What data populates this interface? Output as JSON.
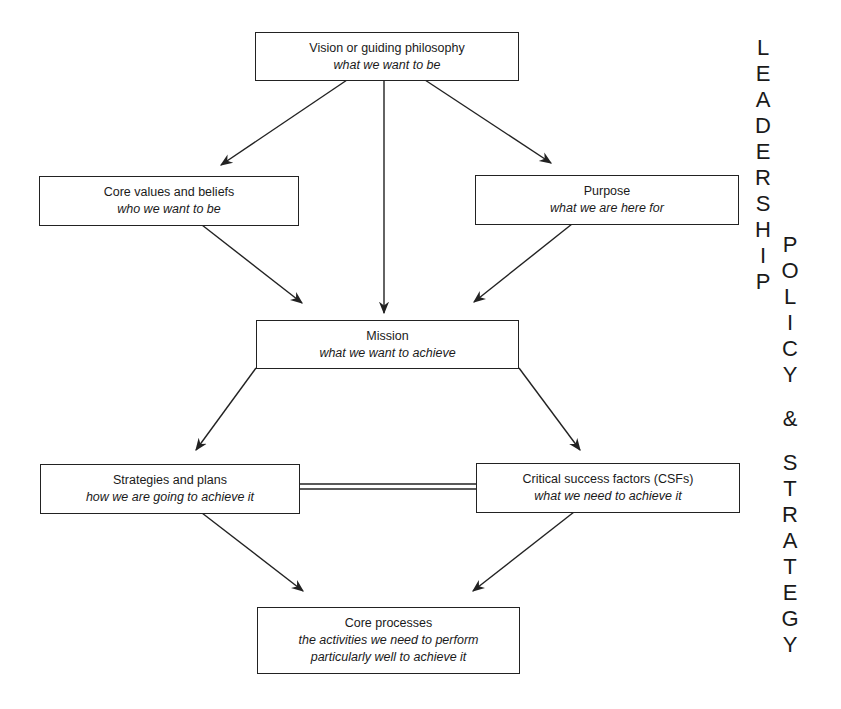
{
  "boxes": {
    "vision": {
      "title": "Vision or guiding philosophy",
      "subtitle": "what we want to be"
    },
    "core_values": {
      "title": "Core values and beliefs",
      "subtitle": "who we want to be"
    },
    "purpose": {
      "title": "Purpose",
      "subtitle": "what we are here for"
    },
    "mission": {
      "title": "Mission",
      "subtitle": "what we want to achieve"
    },
    "strategies": {
      "title": "Strategies and plans",
      "subtitle": "how we are going to achieve it"
    },
    "csfs": {
      "title": "Critical success factors (CSFs)",
      "subtitle": "what we need to achieve it"
    },
    "core_processes": {
      "title": "Core processes",
      "subtitle_line1": "the activities we need to perform",
      "subtitle_line2": "particularly well to achieve it"
    }
  },
  "side_labels": {
    "leadership": [
      "L",
      "E",
      "A",
      "D",
      "E",
      "R",
      "S",
      "H",
      "I",
      "P"
    ],
    "policy": [
      "P",
      "O",
      "L",
      "I",
      "C",
      "Y"
    ],
    "ampersand": "&",
    "strategy": [
      "S",
      "T",
      "R",
      "A",
      "T",
      "E",
      "G",
      "Y"
    ]
  },
  "colors": {
    "stroke": "#222222",
    "text": "#1a1a1a",
    "background": "#ffffff"
  }
}
